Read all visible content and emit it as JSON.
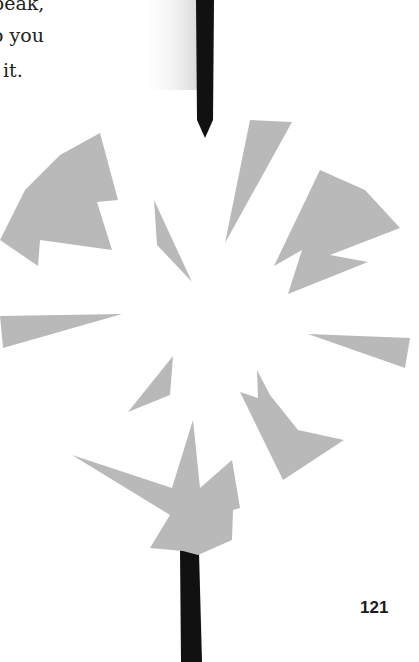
{
  "text": {
    "lines": [
      "peak,",
      "o you",
      "it."
    ]
  },
  "page_number": "121",
  "colors": {
    "shard": "#b9b9b9",
    "stick": "#111111",
    "background": "#ffffff"
  }
}
